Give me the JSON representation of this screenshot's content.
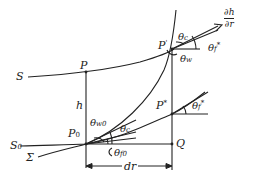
{
  "diagram": {
    "type": "geometric-construction",
    "line_color": "#222222",
    "curves": [
      {
        "id": "S",
        "label": "S"
      },
      {
        "id": "S0",
        "label": "S",
        "subscript": "0"
      },
      {
        "id": "Sigma",
        "label": "Σ"
      }
    ],
    "points": {
      "P": {
        "label": "P"
      },
      "P_prime": {
        "label": "P",
        "superscript": "'"
      },
      "P0": {
        "label": "P",
        "subscript": "0"
      },
      "P_star": {
        "label": "P",
        "superscript": "*"
      },
      "Q": {
        "label": "Q"
      }
    },
    "angles": {
      "theta_c_top": {
        "label": "θ",
        "subscript": "c"
      },
      "theta_w": {
        "label": "θ",
        "subscript": "w"
      },
      "theta_f_top": {
        "label": "θ",
        "subscript": "f",
        "superscript": "*"
      },
      "theta_w0": {
        "label": "θ",
        "subscript": "w0"
      },
      "theta_c_bottom": {
        "label": "θ",
        "subscript": "c"
      },
      "theta_f0": {
        "label": "θ",
        "subscript": "f0"
      },
      "theta_f_star": {
        "label": "θ",
        "subscript": "f",
        "superscript": "*"
      }
    },
    "dimensions": {
      "h": {
        "label": "h"
      },
      "dr": {
        "label": "dr"
      }
    },
    "gradient": {
      "numerator": "∂h",
      "denominator": "∂r"
    }
  }
}
